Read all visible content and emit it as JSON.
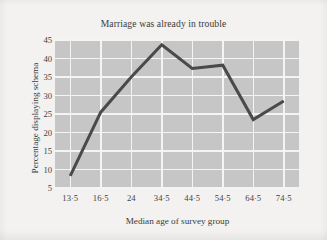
{
  "chart_data": {
    "type": "line",
    "title": "Marriage was already in trouble",
    "xlabel": "Median age of survey group",
    "ylabel": "Percentage displaying schema",
    "categories": [
      "13·5",
      "16·5",
      "24",
      "34·5",
      "44·5",
      "54·5",
      "64·5",
      "74·5"
    ],
    "x_values": [
      13.5,
      16.5,
      24,
      34.5,
      44.5,
      54.5,
      64.5,
      74.5
    ],
    "values": [
      8.3,
      25.5,
      35.0,
      43.7,
      37.3,
      38.2,
      23.5,
      28.5
    ],
    "ylim": [
      5,
      45
    ],
    "yticks": [
      45,
      40,
      35,
      30,
      25,
      20,
      15,
      10,
      5
    ],
    "ytick_labels": [
      "45",
      "40",
      "35",
      "30",
      "25",
      "20",
      "15",
      "10",
      "5"
    ],
    "xticks": [
      13.5,
      16.5,
      24,
      34.5,
      44.5,
      54.5,
      64.5,
      74.5
    ],
    "xtick_labels": [
      "13·5",
      "16·5",
      "24",
      "34·5",
      "44·5",
      "54·5",
      "64·5",
      "74·5"
    ],
    "grid": true,
    "legend": false,
    "legend_position": "none",
    "series": [
      {
        "name": "Percentage displaying schema",
        "values": [
          8.3,
          25.5,
          35.0,
          43.7,
          37.3,
          38.2,
          23.5,
          28.5
        ]
      }
    ],
    "colors": {
      "line": "#4a4a4a",
      "plot_background": "#c6c6c6",
      "gridline": "#f4f4f4",
      "figure_background": "#f3f2f0",
      "text": "#3b3b3b"
    },
    "line_width_px": 3
  }
}
